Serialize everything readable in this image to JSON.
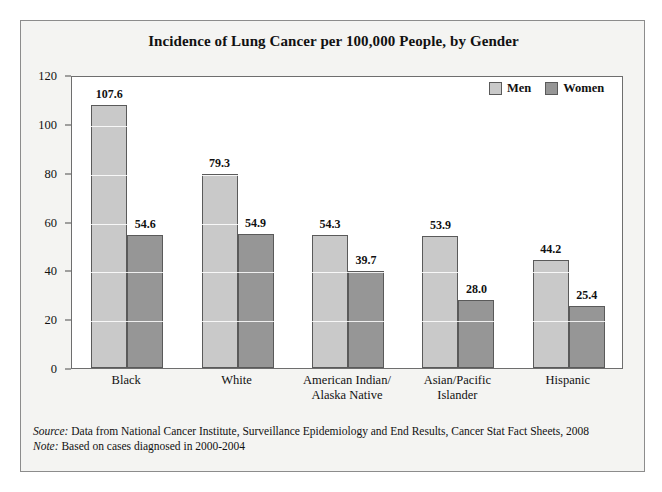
{
  "figure": {
    "title": "Incidence of Lung Cancer per 100,000 People, by Gender",
    "source_key": "Source:",
    "source_text": " Data from National Cancer Institute, Surveillance Epidemiology and End Results, Cancer Stat Fact Sheets, 2008",
    "note_key": "Note:",
    "note_text": " Based on cases diagnosed in 2000-2004"
  },
  "legend": {
    "position": "top-right",
    "items": [
      {
        "label": "Men",
        "color": "#c9c9c9"
      },
      {
        "label": "Women",
        "color": "#969696"
      }
    ]
  },
  "chart_data": {
    "type": "bar",
    "title": "Incidence of Lung Cancer per 100,000 People, by Gender",
    "xlabel": "",
    "ylabel": "",
    "ylim": [
      0,
      120
    ],
    "yticks": [
      0,
      20,
      40,
      60,
      80,
      100,
      120
    ],
    "ytick_labels": [
      "0",
      "20",
      "40",
      "60",
      "80",
      "100",
      "120"
    ],
    "grid": true,
    "legend_position": "top-right",
    "categories": [
      "Black",
      "White",
      "American Indian/\nAlaska Native",
      "Asian/Pacific\nIslander",
      "Hispanic"
    ],
    "category_lines": [
      [
        "Black"
      ],
      [
        "White"
      ],
      [
        "American Indian/",
        "Alaska Native"
      ],
      [
        "Asian/Pacific",
        "Islander"
      ],
      [
        "Hispanic"
      ]
    ],
    "series": [
      {
        "name": "Men",
        "color": "#c9c9c9",
        "values": [
          107.6,
          79.3,
          54.3,
          53.9,
          44.2
        ],
        "value_labels": [
          "107.6",
          "79.3",
          "54.3",
          "53.9",
          "44.2"
        ]
      },
      {
        "name": "Women",
        "color": "#969696",
        "values": [
          54.6,
          54.9,
          39.7,
          28.0,
          25.4
        ],
        "value_labels": [
          "54.6",
          "54.9",
          "39.7",
          "28.0",
          "25.4"
        ]
      }
    ]
  }
}
